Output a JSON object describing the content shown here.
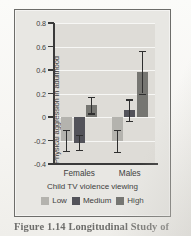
{
  "caption": "Figure 1.14  Longitudinal Study of",
  "colors": {
    "low": "#b4b3ae",
    "medium": "#53535a",
    "high": "#767672",
    "axis": "#3a3a3a",
    "panel_bg": "#e8e7e3",
    "plot_bg": "#dedcd7",
    "gridline": "#f7f7f5"
  },
  "chart_data": {
    "type": "bar",
    "title": "",
    "xlabel": "Child TV violence viewing",
    "ylabel": "Physical aggression in adulthood",
    "categories": [
      "Females",
      "Males"
    ],
    "ylim": [
      -0.4,
      0.8
    ],
    "yticks": [
      "0.8",
      "0.6",
      "0.4",
      "0.2",
      "0",
      "-0.2",
      "-0.4"
    ],
    "ytick_values": [
      0.8,
      0.6,
      0.4,
      0.2,
      0,
      -0.2,
      -0.4
    ],
    "grid": true,
    "legend_position": "bottom",
    "series": [
      {
        "name": "Low",
        "color": "#b4b3ae",
        "values": [
          -0.2,
          -0.2
        ],
        "err_low": [
          -0.29,
          -0.3
        ],
        "err_high": [
          -0.11,
          -0.11
        ]
      },
      {
        "name": "Medium",
        "color": "#53535a",
        "values": [
          -0.22,
          0.06
        ],
        "err_low": [
          -0.28,
          -0.03
        ],
        "err_high": [
          -0.15,
          0.15
        ]
      },
      {
        "name": "High",
        "color": "#767672",
        "values": [
          0.1,
          0.38
        ],
        "err_low": [
          0.03,
          0.2
        ],
        "err_high": [
          0.17,
          0.56
        ]
      }
    ]
  }
}
